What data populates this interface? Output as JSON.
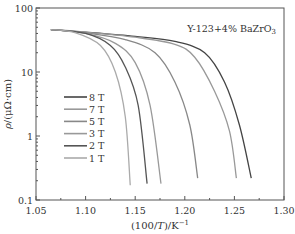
{
  "chart_data": {
    "type": "line",
    "title": "",
    "annotation": "Y-123+4% BaZrO3",
    "xlabel": "(100/T)/K^-1",
    "ylabel": "ρ/(μΩ·cm)",
    "xlim": [
      1.05,
      1.3
    ],
    "ylim": [
      0.1,
      100
    ],
    "yscale": "log",
    "x_ticks": [
      "1.05",
      "1.10",
      "1.15",
      "1.20",
      "1.25",
      "1.30"
    ],
    "y_ticks": [
      "0.1",
      "1",
      "10",
      "100"
    ],
    "grid": false,
    "legend_position": "center-left",
    "series": [
      {
        "name": "8 T",
        "color": "#444444",
        "points": [
          [
            1.065,
            46
          ],
          [
            1.1,
            42
          ],
          [
            1.15,
            36
          ],
          [
            1.19,
            30
          ],
          [
            1.22,
            20
          ],
          [
            1.24,
            7
          ],
          [
            1.255,
            1.5
          ],
          [
            1.267,
            0.22
          ]
        ]
      },
      {
        "name": "7 T",
        "color": "#999999",
        "points": [
          [
            1.065,
            46
          ],
          [
            1.1,
            42
          ],
          [
            1.15,
            35
          ],
          [
            1.19,
            27
          ],
          [
            1.21,
            17
          ],
          [
            1.23,
            5
          ],
          [
            1.245,
            1.2
          ],
          [
            1.252,
            0.22
          ]
        ]
      },
      {
        "name": "5 T",
        "color": "#888888",
        "points": [
          [
            1.065,
            46
          ],
          [
            1.1,
            41
          ],
          [
            1.14,
            32
          ],
          [
            1.17,
            20
          ],
          [
            1.19,
            7
          ],
          [
            1.205,
            1.5
          ],
          [
            1.213,
            0.22
          ]
        ]
      },
      {
        "name": "3 T",
        "color": "#999999",
        "points": [
          [
            1.065,
            46
          ],
          [
            1.1,
            40
          ],
          [
            1.13,
            28
          ],
          [
            1.15,
            14
          ],
          [
            1.165,
            3
          ],
          [
            1.176,
            0.18
          ]
        ]
      },
      {
        "name": "2 T",
        "color": "#555555",
        "points": [
          [
            1.065,
            46
          ],
          [
            1.1,
            40
          ],
          [
            1.125,
            26
          ],
          [
            1.14,
            12
          ],
          [
            1.153,
            3
          ],
          [
            1.162,
            0.18
          ]
        ]
      },
      {
        "name": "1 T",
        "color": "#aaaaaa",
        "points": [
          [
            1.065,
            46
          ],
          [
            1.09,
            41
          ],
          [
            1.115,
            26
          ],
          [
            1.13,
            10
          ],
          [
            1.14,
            2
          ],
          [
            1.145,
            0.17
          ]
        ]
      }
    ]
  }
}
